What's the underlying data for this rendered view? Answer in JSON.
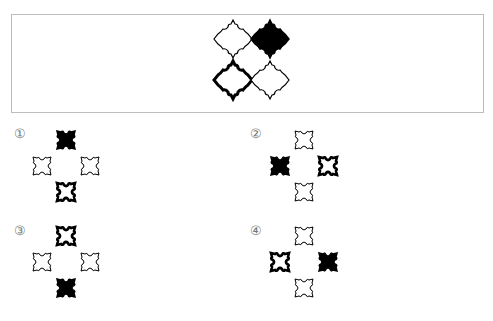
{
  "question": {
    "tiles": [
      {
        "position": "top-left",
        "style": "thin-outline"
      },
      {
        "position": "top-right",
        "style": "filled"
      },
      {
        "position": "bottom-left",
        "style": "thick-outline"
      },
      {
        "position": "bottom-right",
        "style": "thin-outline"
      }
    ]
  },
  "options": [
    {
      "label": "①",
      "top": "filled",
      "left": "thin-outline",
      "right": "thin-outline",
      "bottom": "thick-outline"
    },
    {
      "label": "②",
      "top": "thin-outline",
      "left": "filled",
      "right": "thick-outline",
      "bottom": "thin-outline"
    },
    {
      "label": "③",
      "top": "thick-outline",
      "left": "thin-outline",
      "right": "thin-outline",
      "bottom": "filled"
    },
    {
      "label": "④",
      "top": "thin-outline",
      "left": "thick-outline",
      "right": "filled",
      "bottom": "thin-outline"
    }
  ],
  "colors": {
    "ink": "#000000",
    "border": "#bdbdbd",
    "label": "#777777"
  }
}
